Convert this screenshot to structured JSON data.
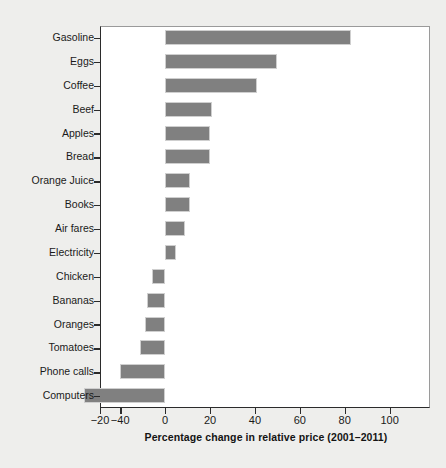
{
  "chart_data": {
    "type": "bar",
    "orientation": "horizontal",
    "title": "",
    "xlabel": "Percentage change in relative price (2001–2011)",
    "ylabel": "",
    "categories": [
      "Gasoline",
      "Eggs",
      "Coffee",
      "Beef",
      "Apples",
      "Bread",
      "Orange Juice",
      "Books",
      "Air fares",
      "Electricity",
      "Chicken",
      "Bananas",
      "Oranges",
      "Tomatoes",
      "Phone calls",
      "Computers"
    ],
    "values": [
      83,
      50,
      41,
      21,
      20,
      20,
      11,
      11,
      9,
      5,
      -6,
      -8,
      -9,
      -11,
      -20,
      -36
    ],
    "xlim": [
      -29,
      118
    ],
    "xticks": [
      -29,
      -20,
      0,
      20,
      40,
      60,
      80,
      100
    ],
    "xticklabels": [
      "−20",
      "−40",
      "0",
      "20",
      "40",
      "60",
      "80",
      "100"
    ],
    "grid": false,
    "legend": null,
    "bar_color": "#808080",
    "plot_background": "#ffffff",
    "figure_background": "#eeeeec"
  }
}
